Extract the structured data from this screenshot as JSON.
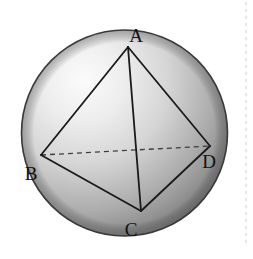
{
  "figure": {
    "background_color": "#ffffff",
    "sphere": {
      "name": "sphere",
      "center_x": 124.5,
      "center_y": 133,
      "radius": 103,
      "outline_color": "#3a3a3a",
      "outline_width": 1.6,
      "highlight_color": "#fafafa",
      "mid_color": "#c9c9c9",
      "shadow_color": "#6c6c6c",
      "highlight_x": 62,
      "highlight_y": 70
    },
    "solid": {
      "name": "tetrahedron",
      "edge_color": "#1a1a1a",
      "edge_width": 1.8,
      "hidden_edge_color": "#3d3d3d",
      "hidden_edge_width": 1.3,
      "hidden_edge_dash": "5 4"
    },
    "vertices": [
      {
        "id": "A",
        "label": "A",
        "x": 128,
        "y": 47,
        "label_x": 136,
        "label_y": 42
      },
      {
        "id": "B",
        "label": "B",
        "x": 41,
        "y": 155,
        "label_x": 31,
        "label_y": 180
      },
      {
        "id": "C",
        "label": "C",
        "x": 141,
        "y": 211,
        "label_x": 131,
        "label_y": 236
      },
      {
        "id": "D",
        "label": "D",
        "x": 210,
        "y": 146,
        "label_x": 209,
        "label_y": 168
      }
    ],
    "edges": [
      {
        "id": "AB",
        "from": "A",
        "to": "B",
        "style": "solid",
        "hidden": false
      },
      {
        "id": "AC",
        "from": "A",
        "to": "C",
        "style": "solid",
        "hidden": false
      },
      {
        "id": "AD",
        "from": "A",
        "to": "D",
        "style": "solid",
        "hidden": false
      },
      {
        "id": "BC",
        "from": "B",
        "to": "C",
        "style": "solid",
        "hidden": false
      },
      {
        "id": "CD",
        "from": "C",
        "to": "D",
        "style": "solid",
        "hidden": false
      },
      {
        "id": "BD",
        "from": "B",
        "to": "D",
        "style": "dashed",
        "hidden": true
      }
    ],
    "crop_marker": {
      "name": "page-crop-marker",
      "x": 246,
      "y_top": 2,
      "y_bottom": 246,
      "color": "#cfcfcf"
    }
  }
}
